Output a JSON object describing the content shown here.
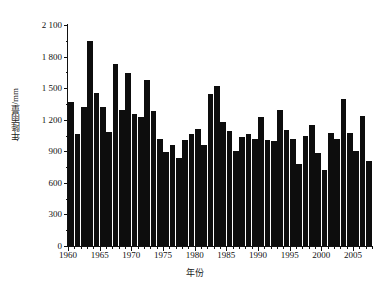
{
  "chart_data": {
    "type": "bar",
    "title": "",
    "xlabel": "年份",
    "ylabel": "年降雨量/mm",
    "ylim": [
      0,
      2100
    ],
    "xlim": [
      1959.5,
      2007.5
    ],
    "y_ticks": [
      0,
      300,
      600,
      900,
      1200,
      1500,
      1800,
      2100
    ],
    "y_tick_labels": [
      "0",
      "300",
      "600",
      "900",
      "1 200",
      "1 500",
      "1 800",
      "2 100"
    ],
    "y_minor_tick_step": 150,
    "x_tick_labels": [
      "1960",
      "1965",
      "1970",
      "1975",
      "1980",
      "1985",
      "1990",
      "1995",
      "2000",
      "2005"
    ],
    "x_tick_values": [
      1960,
      1965,
      1970,
      1975,
      1980,
      1985,
      1990,
      1995,
      2000,
      2005
    ],
    "x_minor_tick_step": 1,
    "grid": false,
    "legend": null,
    "bar_color": "#0d0d0d",
    "axis_color": "#111111",
    "categories": [
      1960,
      1961,
      1962,
      1963,
      1964,
      1965,
      1966,
      1967,
      1968,
      1969,
      1970,
      1971,
      1972,
      1973,
      1974,
      1975,
      1976,
      1977,
      1978,
      1979,
      1980,
      1981,
      1982,
      1983,
      1984,
      1985,
      1986,
      1987,
      1988,
      1989,
      1990,
      1991,
      1992,
      1993,
      1994,
      1995,
      1996,
      1997,
      1998,
      1999,
      2000,
      2001,
      2002,
      2003,
      2004,
      2005,
      2006,
      2007
    ],
    "values": [
      1370,
      1060,
      1320,
      1950,
      1450,
      1320,
      1080,
      1730,
      1290,
      1640,
      1250,
      1230,
      1580,
      1280,
      1020,
      890,
      960,
      840,
      1010,
      1060,
      1110,
      960,
      1440,
      1520,
      1180,
      1090,
      900,
      1040,
      1060,
      1020,
      1230,
      1010,
      1000,
      1290,
      1100,
      1020,
      780,
      1050,
      1150,
      880,
      720,
      1070,
      1020,
      1400,
      1070,
      900,
      1240,
      810
    ]
  }
}
